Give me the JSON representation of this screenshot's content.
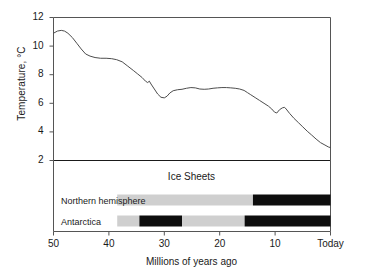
{
  "chart_data": {
    "type": "line",
    "title": "",
    "xlabel": "Millions of years ago",
    "ylabel": "Temperature, °C",
    "xlim": [
      50,
      0
    ],
    "ylim": [
      2,
      12
    ],
    "x_ticks": [
      {
        "value": 50,
        "label": "50"
      },
      {
        "value": 40,
        "label": "40"
      },
      {
        "value": 30,
        "label": "30"
      },
      {
        "value": 20,
        "label": "20"
      },
      {
        "value": 10,
        "label": "10"
      },
      {
        "value": 0,
        "label": "Today"
      }
    ],
    "y_ticks": [
      {
        "value": 12,
        "label": "12"
      },
      {
        "value": 10,
        "label": "10"
      },
      {
        "value": 8,
        "label": "8"
      },
      {
        "value": 6,
        "label": "6"
      },
      {
        "value": 4,
        "label": "4"
      },
      {
        "value": 2,
        "label": "2"
      }
    ],
    "grid": false,
    "legend": "none",
    "line_color": "#4d4d4d",
    "series": [
      {
        "name": "Global temperature",
        "points": [
          [
            50.0,
            10.9
          ],
          [
            49.3,
            11.05
          ],
          [
            48.6,
            11.1
          ],
          [
            48.0,
            11.05
          ],
          [
            47.4,
            10.9
          ],
          [
            46.6,
            10.6
          ],
          [
            45.8,
            10.2
          ],
          [
            45.0,
            9.8
          ],
          [
            44.2,
            9.45
          ],
          [
            43.4,
            9.3
          ],
          [
            42.5,
            9.2
          ],
          [
            41.5,
            9.15
          ],
          [
            40.5,
            9.15
          ],
          [
            39.5,
            9.12
          ],
          [
            38.6,
            9.05
          ],
          [
            37.6,
            8.9
          ],
          [
            36.6,
            8.6
          ],
          [
            35.6,
            8.3
          ],
          [
            34.8,
            8.05
          ],
          [
            34.0,
            7.8
          ],
          [
            33.4,
            7.55
          ],
          [
            33.0,
            7.45
          ],
          [
            32.7,
            7.55
          ],
          [
            32.4,
            7.35
          ],
          [
            31.8,
            7.0
          ],
          [
            31.2,
            6.65
          ],
          [
            30.6,
            6.42
          ],
          [
            30.0,
            6.38
          ],
          [
            29.5,
            6.5
          ],
          [
            29.0,
            6.72
          ],
          [
            28.4,
            6.88
          ],
          [
            27.6,
            6.95
          ],
          [
            26.8,
            6.98
          ],
          [
            26.0,
            7.05
          ],
          [
            25.2,
            7.1
          ],
          [
            24.4,
            7.08
          ],
          [
            23.6,
            7.0
          ],
          [
            22.8,
            6.98
          ],
          [
            22.0,
            7.0
          ],
          [
            21.2,
            7.05
          ],
          [
            20.4,
            7.08
          ],
          [
            19.6,
            7.1
          ],
          [
            18.8,
            7.1
          ],
          [
            18.0,
            7.08
          ],
          [
            17.2,
            7.05
          ],
          [
            16.4,
            7.0
          ],
          [
            15.6,
            6.9
          ],
          [
            15.0,
            6.75
          ],
          [
            14.4,
            6.6
          ],
          [
            13.6,
            6.4
          ],
          [
            12.8,
            6.2
          ],
          [
            12.0,
            6.0
          ],
          [
            11.2,
            5.8
          ],
          [
            10.6,
            5.6
          ],
          [
            10.1,
            5.38
          ],
          [
            9.7,
            5.32
          ],
          [
            9.2,
            5.55
          ],
          [
            8.7,
            5.68
          ],
          [
            8.3,
            5.72
          ],
          [
            8.0,
            5.6
          ],
          [
            7.4,
            5.3
          ],
          [
            6.6,
            4.95
          ],
          [
            5.8,
            4.65
          ],
          [
            5.0,
            4.35
          ],
          [
            4.2,
            4.05
          ],
          [
            3.4,
            3.78
          ],
          [
            2.6,
            3.5
          ],
          [
            1.8,
            3.25
          ],
          [
            1.0,
            3.08
          ],
          [
            0.4,
            2.95
          ],
          [
            0.0,
            2.9
          ]
        ]
      }
    ],
    "ice_sheets": {
      "panel_title": "Ice Sheets",
      "panel_range": [
        50,
        0
      ],
      "colors": {
        "partial": "#cfcfcf",
        "full": "#0d0d0d"
      },
      "bands": [
        {
          "label": "Northern hemisphere",
          "segments": [
            {
              "from": 38.5,
              "to": 14.0,
              "state": "partial"
            },
            {
              "from": 14.0,
              "to": 0.0,
              "state": "full"
            }
          ]
        },
        {
          "label": "Antarctica",
          "segments": [
            {
              "from": 38.5,
              "to": 34.5,
              "state": "partial"
            },
            {
              "from": 34.5,
              "to": 26.8,
              "state": "full"
            },
            {
              "from": 26.8,
              "to": 15.5,
              "state": "partial"
            },
            {
              "from": 15.5,
              "to": 0.0,
              "state": "full"
            }
          ]
        }
      ]
    }
  }
}
